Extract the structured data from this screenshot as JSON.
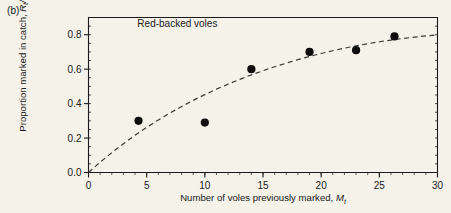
{
  "panel": {
    "label": "(b)"
  },
  "colors": {
    "background": "#f4f2e9",
    "axis": "#1a1a1a",
    "marker": "#0d0d0d",
    "curve": "#3a3a38"
  },
  "chart_data": {
    "type": "scatter",
    "title": "",
    "annotations": [
      {
        "text": "Red-backed voles",
        "x": 4.2,
        "y": 0.845
      }
    ],
    "xlabel_plain": "Number of voles previously marked, Mt",
    "ylabel_plain": "Proportion marked in catch, Rt/Ct",
    "xlabel_parts": {
      "text": "Number of voles previously marked,",
      "var": "M",
      "sub": "t"
    },
    "ylabel_parts": {
      "text": "Proportion marked in catch,",
      "var1": "R",
      "sub1": "t",
      "slash": "/",
      "var2": "C",
      "sub2": "t"
    },
    "xlim": [
      0,
      30
    ],
    "ylim": [
      0.0,
      0.9
    ],
    "xticks": [
      0,
      5,
      10,
      15,
      20,
      25,
      30
    ],
    "xtick_labels": [
      "0",
      "5",
      "10",
      "15",
      "20",
      "25",
      "30"
    ],
    "yticks": [
      0.0,
      0.2,
      0.4,
      0.6,
      0.8
    ],
    "ytick_labels": [
      "0.0",
      "0.2",
      "0.4",
      "0.6",
      "0.8"
    ],
    "minor_xtick_step": 1,
    "minor_ytick_step": 0.05,
    "grid": false,
    "legend": "none",
    "series": [
      {
        "name": "Red-backed voles",
        "marker": "filled-circle",
        "x": [
          4.3,
          10.0,
          14.0,
          19.0,
          23.0,
          26.3
        ],
        "y": [
          0.3,
          0.29,
          0.6,
          0.7,
          0.71,
          0.79
        ]
      }
    ],
    "fitted_curve": {
      "name": "fitted saturating curve",
      "style": "dashed",
      "x": [
        0,
        1,
        2,
        3,
        4,
        5,
        6,
        7,
        8,
        9,
        10,
        11,
        12,
        13,
        14,
        15,
        16,
        17,
        18,
        19,
        20,
        21,
        22,
        23,
        24,
        25,
        26,
        27,
        28,
        29,
        30
      ],
      "y": [
        0.0,
        0.06,
        0.115,
        0.167,
        0.216,
        0.262,
        0.305,
        0.345,
        0.383,
        0.419,
        0.452,
        0.484,
        0.513,
        0.541,
        0.567,
        0.591,
        0.614,
        0.635,
        0.655,
        0.674,
        0.691,
        0.707,
        0.722,
        0.735,
        0.748,
        0.759,
        0.769,
        0.778,
        0.786,
        0.793,
        0.799
      ]
    }
  }
}
